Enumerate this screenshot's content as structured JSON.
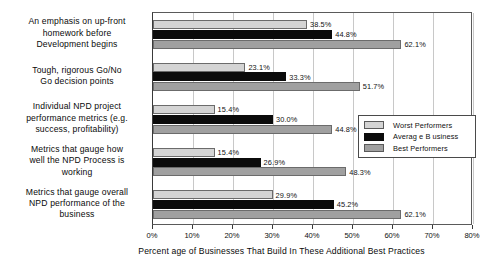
{
  "chart_data": {
    "type": "bar",
    "orientation": "horizontal",
    "title": "",
    "xlabel": "Percent age of Businesses   That Build In These  Additional Best  Practices",
    "ylabel": "",
    "xlim": [
      0,
      80
    ],
    "xtick_labels": [
      "0%",
      "10%",
      "20%",
      "30%",
      "40%",
      "50%",
      "60%",
      "70%",
      "80%"
    ],
    "xticks": [
      0,
      10,
      20,
      30,
      40,
      50,
      60,
      70,
      80
    ],
    "grid": true,
    "legend_position": "inside-bottom-right",
    "categories": [
      "An emphasis  on up-front\nhomework  before\nDevelopment  begins",
      "Tough, rigorous Go/No\nGo decision  points",
      "Individual  NPD  project\nperformance  metrics (e.g.\nsuccess,   profitability)",
      "Metrics that gauge  how\nwell the NPD  Process  is\nworking",
      "Metrics that gauge  overall\nNPD  performance  of the\nbusiness"
    ],
    "series": [
      {
        "name": "Worst  Performers",
        "color": "#d4d4d4",
        "values": [
          38.5,
          23.1,
          15.4,
          15.4,
          29.9
        ],
        "labels": [
          "38.5%",
          "23.1%",
          "15.4%",
          "15.4%",
          "29.9%"
        ]
      },
      {
        "name": "Averag e B usiness",
        "color": "#0b0b0b",
        "values": [
          44.8,
          33.3,
          30.0,
          26.9,
          45.2
        ],
        "labels": [
          "44.8%",
          "33.3%",
          "30.0%",
          "26.9%",
          "45.2%"
        ]
      },
      {
        "name": "Best   Performers",
        "color": "#a0a0a0",
        "values": [
          62.1,
          51.7,
          44.8,
          48.3,
          62.1
        ],
        "labels": [
          "62.1%",
          "51.7%",
          "44.8%",
          "48.3%",
          "62.1%"
        ]
      }
    ]
  }
}
